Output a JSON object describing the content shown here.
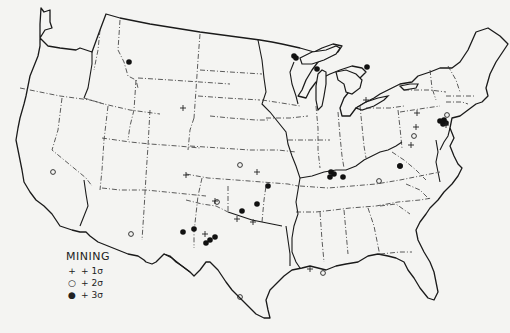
{
  "map": {
    "title": "MINING",
    "region": "Contiguous United States"
  },
  "legend": {
    "title": "MINING",
    "items": [
      {
        "symbol": "plus",
        "glyph": "+",
        "label": "+ 1σ"
      },
      {
        "symbol": "open-circle",
        "glyph": "○",
        "label": "+ 2σ"
      },
      {
        "symbol": "filled-circle",
        "glyph": "●",
        "label": "+ 3σ"
      }
    ]
  },
  "markers": [
    {
      "type": "filled",
      "x": 129,
      "y": 62
    },
    {
      "type": "filled",
      "x": 294,
      "y": 56
    },
    {
      "type": "filled",
      "x": 296,
      "y": 58
    },
    {
      "type": "filled",
      "x": 317,
      "y": 69
    },
    {
      "type": "filled",
      "x": 367,
      "y": 67
    },
    {
      "type": "plus",
      "x": 183,
      "y": 108
    },
    {
      "type": "plus",
      "x": 366,
      "y": 100
    },
    {
      "type": "open",
      "x": 240,
      "y": 165
    },
    {
      "type": "plus",
      "x": 257,
      "y": 172
    },
    {
      "type": "filled",
      "x": 268,
      "y": 186
    },
    {
      "type": "plus",
      "x": 186,
      "y": 175
    },
    {
      "type": "plus",
      "x": 215,
      "y": 201
    },
    {
      "type": "open",
      "x": 217,
      "y": 202
    },
    {
      "type": "filled",
      "x": 257,
      "y": 204
    },
    {
      "type": "filled",
      "x": 242,
      "y": 211
    },
    {
      "type": "plus",
      "x": 237,
      "y": 219
    },
    {
      "type": "plus",
      "x": 253,
      "y": 222
    },
    {
      "type": "filled",
      "x": 183,
      "y": 232
    },
    {
      "type": "filled",
      "x": 194,
      "y": 229
    },
    {
      "type": "plus",
      "x": 205,
      "y": 234
    },
    {
      "type": "filled",
      "x": 215,
      "y": 237
    },
    {
      "type": "filled",
      "x": 210,
      "y": 240
    },
    {
      "type": "filled",
      "x": 206,
      "y": 243
    },
    {
      "type": "open",
      "x": 240,
      "y": 297
    },
    {
      "type": "open",
      "x": 53,
      "y": 172
    },
    {
      "type": "open",
      "x": 131,
      "y": 234
    },
    {
      "type": "plus",
      "x": 310,
      "y": 269
    },
    {
      "type": "open",
      "x": 323,
      "y": 273
    },
    {
      "type": "filled",
      "x": 331,
      "y": 172
    },
    {
      "type": "filled",
      "x": 334,
      "y": 174
    },
    {
      "type": "filled",
      "x": 330,
      "y": 177
    },
    {
      "type": "filled",
      "x": 343,
      "y": 177
    },
    {
      "type": "filled",
      "x": 400,
      "y": 166
    },
    {
      "type": "open",
      "x": 379,
      "y": 181
    },
    {
      "type": "plus",
      "x": 417,
      "y": 113
    },
    {
      "type": "plus",
      "x": 416,
      "y": 127
    },
    {
      "type": "open",
      "x": 414,
      "y": 136
    },
    {
      "type": "plus",
      "x": 411,
      "y": 145
    },
    {
      "type": "filled",
      "x": 440,
      "y": 121
    },
    {
      "type": "filled",
      "x": 444,
      "y": 120
    },
    {
      "type": "filled",
      "x": 446,
      "y": 123
    },
    {
      "type": "filled",
      "x": 443,
      "y": 124
    },
    {
      "type": "open",
      "x": 447,
      "y": 115
    },
    {
      "type": "plus",
      "x": 446,
      "y": 125
    },
    {
      "type": "filled",
      "x": 400,
      "y": 166
    }
  ]
}
